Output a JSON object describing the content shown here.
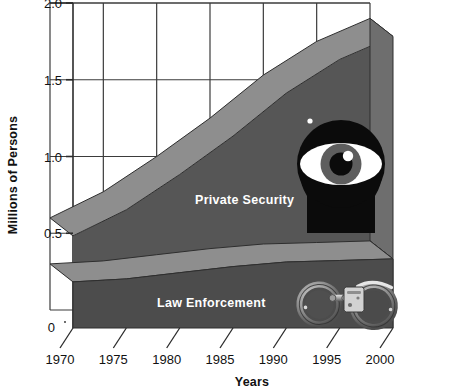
{
  "chart_data": {
    "type": "area",
    "title": "",
    "xlabel": "Years",
    "ylabel": "Millions of Persons",
    "x": [
      1970,
      1975,
      1980,
      1985,
      1990,
      1995,
      2000
    ],
    "xlim": [
      1970,
      2000
    ],
    "ylim": [
      0,
      2.0
    ],
    "ytick_labels": [
      "0",
      "0.5",
      "1.0",
      "1.5",
      "2.0"
    ],
    "ytick_values": [
      0,
      0.5,
      1.0,
      1.5,
      2.0
    ],
    "xtick_labels": [
      "1970",
      "1975",
      "1980",
      "1985",
      "1990",
      "1995",
      "2000"
    ],
    "grid": true,
    "legend": "inline-labels",
    "stacked": true,
    "series": [
      {
        "name": "Law Enforcement",
        "values": [
          0.3,
          0.32,
          0.36,
          0.4,
          0.43,
          0.44,
          0.45
        ],
        "color": "#4a4a4a"
      },
      {
        "name": "Private Security",
        "values": [
          0.3,
          0.45,
          0.64,
          0.85,
          1.1,
          1.31,
          1.45
        ],
        "color": "#555555"
      }
    ],
    "totals": [
      0.6,
      0.77,
      1.0,
      1.25,
      1.53,
      1.75,
      1.9
    ],
    "annotations": [
      "eye-graphic",
      "handcuffs-graphic"
    ]
  },
  "axes": {
    "y_title": "Millions of Persons",
    "x_title": "Years",
    "y_ticks": [
      {
        "label": "2.0",
        "value": 2.0
      },
      {
        "label": "1.5",
        "value": 1.5
      },
      {
        "label": "1.0",
        "value": 1.0
      },
      {
        "label": "0.5",
        "value": 0.5
      },
      {
        "label": "0",
        "value": 0
      }
    ],
    "x_ticks": [
      {
        "label": "1970",
        "value": 1970
      },
      {
        "label": "1975",
        "value": 1975
      },
      {
        "label": "1980",
        "value": 1980
      },
      {
        "label": "1985",
        "value": 1985
      },
      {
        "label": "1990",
        "value": 1990
      },
      {
        "label": "1995",
        "value": 1995
      },
      {
        "label": "2000",
        "value": 2000
      }
    ]
  },
  "series_labels": {
    "upper": "Private Security",
    "lower": "Law Enforcement"
  },
  "colors": {
    "band_front": "#565656",
    "band_front_dark": "#4c4c4c",
    "band_top": "#8e8e8e",
    "band_side": "#6e6e6e",
    "band_side_dark": "#636363",
    "grid": "#3b3b3b",
    "axis": "#2b2b2b",
    "label_text": "#111111",
    "series_text": "#ffffff",
    "eye_black": "#0b0b0b",
    "eye_white": "#ffffff",
    "iris": "#5e5e5e",
    "background": "#ffffff"
  },
  "icons": {
    "eye": "eye-icon",
    "handcuffs": "handcuffs-icon"
  }
}
